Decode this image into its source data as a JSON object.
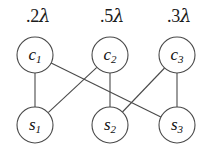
{
  "figure": {
    "width": 206,
    "height": 149,
    "background": "#ffffff",
    "stroke_color": "#4a4a4a",
    "text_color": "#111111"
  },
  "rate_labels": [
    {
      "id": "rate-c1",
      "text": " .2",
      "symbol": "λ",
      "x": 36,
      "y": 16
    },
    {
      "id": "rate-c2",
      "text": " .5",
      "symbol": "λ",
      "x": 110,
      "y": 16
    },
    {
      "id": "rate-c3",
      "text": " .3",
      "symbol": "λ",
      "x": 177,
      "y": 16
    }
  ],
  "nodes": {
    "c1": {
      "label": "c",
      "sub": "1",
      "cx": 35,
      "cy": 55,
      "r": 18
    },
    "c2": {
      "label": "c",
      "sub": "2",
      "cx": 110,
      "cy": 55,
      "r": 18
    },
    "c3": {
      "label": "c",
      "sub": "3",
      "cx": 177,
      "cy": 55,
      "r": 18
    },
    "s1": {
      "label": "s",
      "sub": "1",
      "cx": 35,
      "cy": 125,
      "r": 18
    },
    "s2": {
      "label": "s",
      "sub": "2",
      "cx": 110,
      "cy": 125,
      "r": 18
    },
    "s3": {
      "label": "s",
      "sub": "3",
      "cx": 177,
      "cy": 125,
      "r": 18
    }
  },
  "edges": [
    {
      "id": "edge-c1-s1",
      "from": "c1",
      "to": "s1"
    },
    {
      "id": "edge-c1-s3",
      "from": "c1",
      "to": "s3"
    },
    {
      "id": "edge-c2-s1",
      "from": "c2",
      "to": "s1"
    },
    {
      "id": "edge-c2-s2",
      "from": "c2",
      "to": "s2"
    },
    {
      "id": "edge-c3-s2",
      "from": "c3",
      "to": "s2"
    },
    {
      "id": "edge-c3-s3",
      "from": "c3",
      "to": "s3"
    }
  ]
}
